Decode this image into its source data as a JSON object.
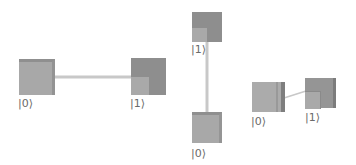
{
  "colors": {
    "background": "#ffffff",
    "connector": "#c6c6c6",
    "box_light": "#a7a7a7",
    "box_dark": "#8e8e8e",
    "box_top_edge": "#8a8a8a",
    "box_side_edge": "#7a7a7a",
    "label": "#6a6a6a"
  },
  "diagrams": [
    {
      "orientation": "horizontal",
      "states": [
        {
          "label": "|0⟩",
          "shade": "light"
        },
        {
          "label": "|1⟩",
          "shade": "dark"
        }
      ]
    },
    {
      "orientation": "vertical",
      "states": [
        {
          "label": "|1⟩",
          "shade": "dark"
        },
        {
          "label": "|0⟩",
          "shade": "light"
        }
      ]
    },
    {
      "orientation": "perspective",
      "states": [
        {
          "label": "|0⟩",
          "shade": "light"
        },
        {
          "label": "|1⟩",
          "shade": "dark"
        }
      ]
    }
  ]
}
